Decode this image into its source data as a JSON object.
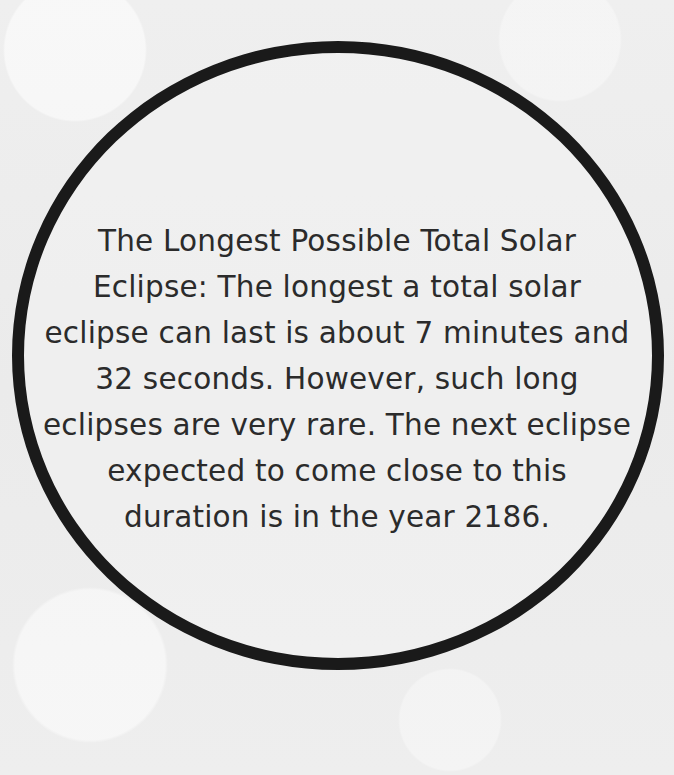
{
  "card": {
    "lines": [
      "The Longest Possible Total Solar",
      "Eclipse: The longest a total solar",
      "eclipse can last is about 7 minutes and",
      "32 seconds. However, such long",
      "eclipses are very rare. The next eclipse",
      "expected to come close to this",
      "duration is in the year 2186."
    ],
    "ring_color": "#1a1a1a",
    "text_color": "#2b2b2b"
  }
}
